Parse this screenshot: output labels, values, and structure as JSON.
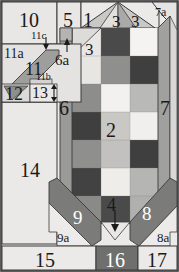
{
  "figure": {
    "type": "patent-style-labeled-diagram",
    "width": 179,
    "height": 272,
    "border_color": "#3a3a3a",
    "palette": {
      "background_light": "#eceae8",
      "panel_light": "#e4e2e0",
      "mid_gray": "#9a9a98",
      "dark_gray": "#4f4f4f",
      "near_white": "#f4f3f1",
      "light_gray": "#c6c6c4",
      "very_dark": "#3d3d3d",
      "outline": "#2b2b2b"
    }
  },
  "labels": {
    "n1": "1",
    "n2": "2",
    "n3_a": "3",
    "n3_b": "3",
    "n3_c": "3",
    "n4": "4",
    "n5": "5",
    "n6": "6",
    "n6a": "6a",
    "n7": "7",
    "n7a": "7a",
    "n8": "8",
    "n8a": "8a",
    "n9": "9",
    "n9a": "9a",
    "n10": "10",
    "n11": "11",
    "n11a": "11a",
    "n11b": "11b",
    "n11c": "11c",
    "n12": "12",
    "n13": "13",
    "n14": "14",
    "n15": "15",
    "n16": "16",
    "n17": "17"
  },
  "grid": {
    "description": "central 3-column by 7-row checkerboard of gray tiles",
    "columns": 3,
    "rows": 7,
    "cells": [
      [
        "#e9e7e5",
        "#4a4a4a",
        "#f4f3f1"
      ],
      [
        "#e7e6e3",
        "#8f8f8d",
        "#3f3f3f"
      ],
      [
        "#8d8d8b",
        "#f2f1ef",
        "#b9b9b7"
      ],
      [
        "#3f3f3f",
        "#c9c8c5",
        "#f0efed"
      ],
      [
        "#8f8f8d",
        "#c2c1bf",
        "#3f3f3f"
      ],
      [
        "#424242",
        "#eeedea",
        "#b5b5b3"
      ],
      [
        "#8a8a88",
        "#4a4a4a",
        "#b0b0ae"
      ]
    ]
  }
}
